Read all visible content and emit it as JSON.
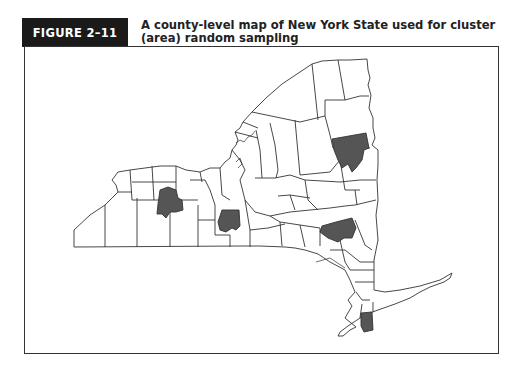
{
  "figure": {
    "label": "FIGURE 2–11",
    "title_line1": "A county-level map of New York State used for cluster",
    "title_line2": "(area) random sampling"
  },
  "map": {
    "region": "New York State",
    "unit": "county",
    "highlighted_count": 5,
    "colors": {
      "outline": "#333333",
      "unselected_fill": "#ffffff",
      "selected_fill": "#555555",
      "label_bg": "#1a1a1a"
    }
  }
}
